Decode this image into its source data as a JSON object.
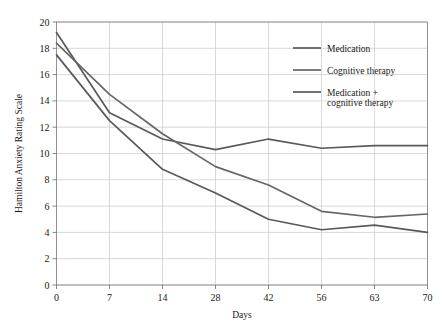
{
  "chart_data": {
    "type": "line",
    "title": "",
    "xlabel": "Days",
    "ylabel": "Hamilton Anxiety Rating Scale",
    "x": [
      0,
      7,
      14,
      28,
      42,
      56,
      63,
      70
    ],
    "categories": [
      "0",
      "7",
      "14",
      "28",
      "42",
      "56",
      "63",
      "70"
    ],
    "xtick_labels": [
      "0",
      "7",
      "14",
      "28",
      "42",
      "56",
      "63",
      "70"
    ],
    "ytick_labels": [
      "0",
      "2",
      "4",
      "6",
      "8",
      "10",
      "12",
      "14",
      "16",
      "18",
      "20"
    ],
    "ylim": [
      0,
      20
    ],
    "ytick_step": 2,
    "grid": true,
    "grid_color": "#c8c8c8",
    "legend_position": "upper-right",
    "x_axis_scale": "categorical-ordinal",
    "series": [
      {
        "name": "Medication",
        "color": "#595959",
        "values": [
          19.2,
          13.1,
          11.1,
          10.3,
          11.1,
          10.4,
          10.6,
          10.6
        ]
      },
      {
        "name": "Cognitive therapy",
        "color": "#666666",
        "values": [
          18.4,
          14.5,
          11.5,
          9.0,
          7.6,
          5.6,
          5.15,
          5.4
        ]
      },
      {
        "name": "Medication + cognitive therapy",
        "color": "#595959",
        "values": [
          17.5,
          12.5,
          8.8,
          7.0,
          5.0,
          4.2,
          4.55,
          4.0
        ]
      }
    ]
  },
  "legend": {
    "entries": [
      {
        "label": "Medication",
        "label_line2": ""
      },
      {
        "label": "Cognitive therapy",
        "label_line2": ""
      },
      {
        "label": "Medication +",
        "label_line2": "cognitive therapy"
      }
    ]
  },
  "axes": {
    "x_title": "Days",
    "y_title": "Hamilton Anxiety Rating Scale"
  },
  "colors": {
    "background": "#ffffff",
    "grid": "#c8c8c8",
    "frame": "#8a8a8a",
    "text": "#1a1a1a",
    "line": "#595959"
  }
}
